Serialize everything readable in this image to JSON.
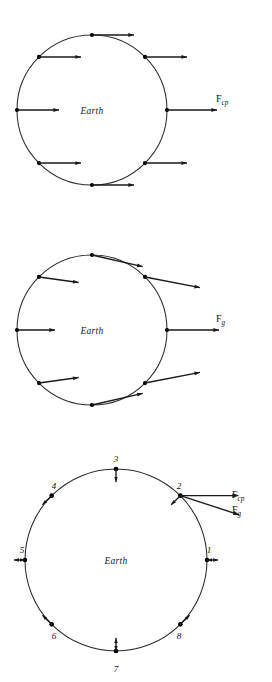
{
  "figure": {
    "background_color": "#ffffff",
    "stroke_color": "#1a1a1a",
    "width": 272,
    "height": 682
  },
  "panels": [
    {
      "id": "panel-centripetal",
      "body_label": "Earth",
      "center": {
        "x": 92,
        "y": 110
      },
      "radius": 75,
      "force_label": {
        "symbol": "F",
        "subscript": "cp"
      },
      "force_label_pos": {
        "x": 216,
        "y": 102
      },
      "description": "Uniform rightward centripetal force vectors of equal length at eight surface points",
      "vectors": [
        {
          "angle_deg": 0,
          "dir_deg": 0,
          "length": 50,
          "label": "point-right"
        },
        {
          "angle_deg": 45,
          "dir_deg": 0,
          "length": 42,
          "label": "point-upper-right"
        },
        {
          "angle_deg": 90,
          "dir_deg": 0,
          "length": 42,
          "label": "point-top"
        },
        {
          "angle_deg": 135,
          "dir_deg": 0,
          "length": 42,
          "label": "point-upper-left"
        },
        {
          "angle_deg": 180,
          "dir_deg": 0,
          "length": 42,
          "label": "point-left"
        },
        {
          "angle_deg": 225,
          "dir_deg": 0,
          "length": 42,
          "label": "point-lower-left"
        },
        {
          "angle_deg": 270,
          "dir_deg": 0,
          "length": 42,
          "label": "point-bottom"
        },
        {
          "angle_deg": 315,
          "dir_deg": 0,
          "length": 42,
          "label": "point-lower-right"
        }
      ]
    },
    {
      "id": "panel-gravity",
      "body_label": "Earth",
      "center": {
        "x": 92,
        "y": 330
      },
      "radius": 75,
      "force_label": {
        "symbol": "F",
        "subscript": "g"
      },
      "force_label_pos": {
        "x": 216,
        "y": 322
      },
      "description": "Gravitational force vectors converging toward a distant mass to the right; magnitude and direction vary with position",
      "converge_point": {
        "x": 420,
        "y": 330
      },
      "vectors": [
        {
          "angle_deg": 0,
          "length": 52,
          "label": "point-right"
        },
        {
          "angle_deg": 45,
          "length": 56,
          "label": "point-upper-right"
        },
        {
          "angle_deg": 90,
          "length": 52,
          "label": "point-top"
        },
        {
          "angle_deg": 135,
          "length": 40,
          "label": "point-upper-left"
        },
        {
          "angle_deg": 180,
          "length": 38,
          "label": "point-left"
        },
        {
          "angle_deg": 225,
          "length": 40,
          "label": "point-lower-left"
        },
        {
          "angle_deg": 270,
          "length": 52,
          "label": "point-bottom"
        },
        {
          "angle_deg": 315,
          "length": 56,
          "label": "point-lower-right"
        }
      ]
    },
    {
      "id": "panel-tidal",
      "body_label": "Earth",
      "center": {
        "x": 116,
        "y": 560
      },
      "radius": 91,
      "description": "Net tidal (residual) forces at eight numbered surface points, plus component vectors at point 2",
      "force_labels": [
        {
          "symbol": "F",
          "subscript": "cp",
          "x": 232,
          "y": 498
        },
        {
          "symbol": "F",
          "subscript": "g",
          "x": 232,
          "y": 513
        }
      ],
      "component_vectors_at_point_2": [
        {
          "name": "F_cp",
          "dir_deg": 0,
          "length": 58
        },
        {
          "name": "F_g",
          "dir_deg": -18,
          "length": 62
        }
      ],
      "points": [
        {
          "number": "1",
          "angle_deg": 0,
          "arrow_deg": 0,
          "arrow_len": 11,
          "double_headed": true,
          "label_x": 209,
          "label_y": 553
        },
        {
          "number": "2",
          "angle_deg": 45,
          "arrow_deg": 225,
          "arrow_len": 13,
          "double_headed": false,
          "label_x": 179,
          "label_y": 489
        },
        {
          "number": "3",
          "angle_deg": 90,
          "arrow_deg": 270,
          "arrow_len": 13,
          "double_headed": false,
          "label_x": 116,
          "label_y": 462
        },
        {
          "number": "4",
          "angle_deg": 135,
          "arrow_deg": 225,
          "arrow_len": 13,
          "double_headed": false,
          "label_x": 54,
          "label_y": 489
        },
        {
          "number": "5",
          "angle_deg": 180,
          "arrow_deg": 180,
          "arrow_len": 11,
          "double_headed": true,
          "label_x": 22,
          "label_y": 553
        },
        {
          "number": "6",
          "angle_deg": 225,
          "arrow_deg": 135,
          "arrow_len": 13,
          "double_headed": false,
          "label_x": 54,
          "label_y": 639
        },
        {
          "number": "7",
          "angle_deg": 270,
          "arrow_deg": 90,
          "arrow_len": 13,
          "double_headed": true,
          "label_x": 116,
          "label_y": 672
        },
        {
          "number": "8",
          "angle_deg": 315,
          "arrow_deg": 45,
          "arrow_len": 13,
          "double_headed": false,
          "label_x": 179,
          "label_y": 639
        }
      ]
    }
  ]
}
